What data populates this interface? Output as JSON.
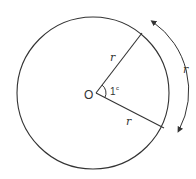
{
  "diagram": {
    "title": "",
    "center_label": "O",
    "angle_label": "1",
    "angle_superscript": "c",
    "radius_label_upper": "r",
    "radius_label_lower": "r",
    "arc_label": "r",
    "stroke_color": "#333333",
    "background": "#ffffff"
  }
}
